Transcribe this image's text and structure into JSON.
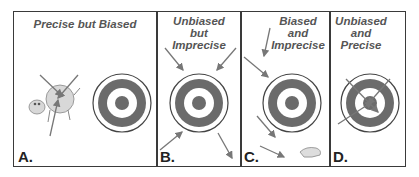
{
  "panels": [
    {
      "letter": "A.",
      "title_lines": [
        "Precise but Biased"
      ],
      "description": "Arrows clustered tightly on a cow beside the target"
    },
    {
      "letter": "B.",
      "title_lines": [
        "Unbiased",
        "but",
        "Imprecise"
      ],
      "description": "Arrows scattered around the target, centered on it"
    },
    {
      "letter": "C.",
      "title_lines": [
        "Biased",
        "and",
        "Imprecise"
      ],
      "description": "Arrows scattered widely, off to one side of the target"
    },
    {
      "letter": "D.",
      "title_lines": [
        "Unbiased",
        "and",
        "Precise"
      ],
      "description": "Arrows clustered on the bullseye"
    }
  ],
  "colors": {
    "border": "#3a3a3a",
    "ring": "#6b6b6b",
    "arrow": "#777777",
    "text": "#555555"
  }
}
